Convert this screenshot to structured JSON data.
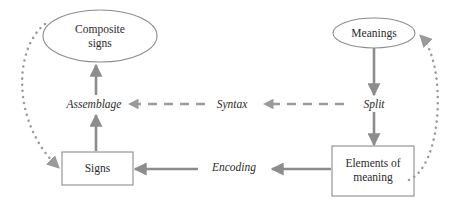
{
  "diagram": {
    "type": "cycle-flow-diagram",
    "colors": {
      "shape_stroke": "#8c8c8c",
      "arrow": "#8c8c8c",
      "dashed_arrow": "#9a9a9a",
      "dotted_arrow": "#9a9a9a",
      "text": "#2b2b2b",
      "background": "#ffffff"
    },
    "nodes": [
      {
        "id": "composite-signs",
        "label": "Composite\nsigns",
        "shape": "ellipse",
        "cx": 100,
        "cy": 36,
        "rx": 57,
        "ry": 26
      },
      {
        "id": "meanings",
        "label": "Meanings",
        "shape": "ellipse",
        "cx": 374,
        "cy": 33,
        "rx": 41,
        "ry": 15
      },
      {
        "id": "signs",
        "label": "Signs",
        "shape": "rect",
        "x": 62,
        "y": 152,
        "width": 71,
        "height": 33
      },
      {
        "id": "elements-of-meaning",
        "label": "Elements of\nmeaning",
        "shape": "rect",
        "x": 332,
        "y": 146,
        "width": 82,
        "height": 50
      }
    ],
    "edge_labels": [
      {
        "id": "assemblage",
        "label": "Assemblage",
        "x": 94,
        "y": 105
      },
      {
        "id": "syntax",
        "label": "Syntax",
        "x": 232,
        "y": 105
      },
      {
        "id": "split",
        "label": "Split",
        "x": 374,
        "y": 105
      },
      {
        "id": "encoding",
        "label": "Encoding",
        "x": 234,
        "y": 168
      }
    ],
    "edges": [
      {
        "id": "signs-to-assemblage",
        "from": "signs",
        "to": "assemblage",
        "style": "solid",
        "direction": "up"
      },
      {
        "id": "assemblage-to-composite-signs",
        "from": "assemblage",
        "to": "composite-signs",
        "style": "solid",
        "direction": "up"
      },
      {
        "id": "syntax-to-assemblage",
        "from": "syntax",
        "to": "assemblage",
        "style": "dashed",
        "direction": "left"
      },
      {
        "id": "split-to-syntax",
        "from": "split",
        "to": "syntax",
        "style": "dashed",
        "direction": "left"
      },
      {
        "id": "meanings-to-split",
        "from": "meanings",
        "to": "split",
        "style": "solid",
        "direction": "down"
      },
      {
        "id": "split-to-elements-of-meaning",
        "from": "split",
        "to": "elements-of-meaning",
        "style": "solid",
        "direction": "down"
      },
      {
        "id": "elements-of-meaning-to-encoding",
        "from": "elements-of-meaning",
        "to": "encoding",
        "style": "solid",
        "direction": "left"
      },
      {
        "id": "encoding-to-signs",
        "from": "encoding",
        "to": "signs",
        "style": "solid",
        "direction": "left"
      },
      {
        "id": "composite-signs-to-signs",
        "from": "composite-signs",
        "to": "signs",
        "style": "dotted",
        "direction": "curve-left-down"
      },
      {
        "id": "elements-of-meaning-to-meanings",
        "from": "elements-of-meaning",
        "to": "meanings",
        "style": "dotted",
        "direction": "curve-right-up"
      }
    ]
  }
}
